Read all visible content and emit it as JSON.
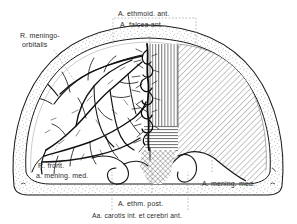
{
  "figure": {
    "type": "anatomical-line-drawing",
    "background_color": "#ffffff",
    "ink_color": "#1a1a1a",
    "leader_color": "#9a9a9a"
  },
  "labels": {
    "ethmoid_ant": "A. ethmoid. ant.",
    "falcea_ant": "A. falcea ant.",
    "meningo_orbitalis": "R. meningo-",
    "meningo_orbitalis_2": "orbitalis",
    "front_mening_med_1": "R. front.",
    "front_mening_med_2": "a. mening. med.",
    "ethm_post": "A. ethm. post.",
    "carotis_cerebri": "Aa. carotis int. et cerebri ant.",
    "mening_med": "A. mening. med."
  },
  "regions": [
    {
      "name": "vertical-hatch-zone",
      "pattern": "vertical-lines",
      "artery": "A. falcea ant."
    },
    {
      "name": "horizontal-hatch-zone",
      "pattern": "horizontal-lines",
      "artery": "A. ethm. post."
    },
    {
      "name": "cross-hatch-zone",
      "pattern": "cross-hatch",
      "artery": "Aa. carotis int. et cerebri ant."
    },
    {
      "name": "diagonal-hatch-zone",
      "pattern": "diagonal-lines",
      "artery": "A. mening. med."
    },
    {
      "name": "stipple-band",
      "pattern": "stipple",
      "artery": "skull vault (bone)"
    },
    {
      "name": "vessel-tree-left",
      "pattern": "line-vessels",
      "artery": "R. front. a. mening. med. / R. meningo-orbitalis"
    }
  ]
}
